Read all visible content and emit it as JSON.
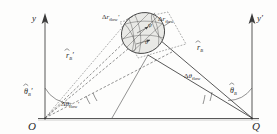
{
  "figure": {
    "background_color": "#fdfdfc",
    "line_color": "#3a3a3a",
    "blob_fill": "#e9e9e6"
  },
  "axes": [
    {
      "name": "left-axis",
      "label": "y",
      "prime": "",
      "x": 45,
      "base_y": 118,
      "top_y": 14
    },
    {
      "name": "right-axis",
      "label": "y",
      "prime": "′",
      "x": 252,
      "base_y": 118,
      "top_y": 14
    }
  ],
  "points": [
    {
      "name": "origin-O",
      "label": "O",
      "x": 33,
      "y": 119
    },
    {
      "name": "origin-Q",
      "label": "Q",
      "x": 256,
      "y": 119
    }
  ],
  "baseline": {
    "name": "baseline",
    "x1": 38,
    "y1": 118,
    "x2": 258,
    "y2": 118
  },
  "blob": {
    "name": "flow-tube-blob",
    "cx": 143,
    "cy": 33,
    "rx": 22,
    "ry": 20,
    "rotation": -28,
    "interior_labels": [
      {
        "name": "interior-angle-upper",
        "text": "ψ"
      },
      {
        "name": "interior-angle-lower",
        "text": "θ"
      }
    ]
  },
  "vectors": [
    {
      "name": "vector-r-prime-B",
      "symbol": "r",
      "hat": true,
      "prime": "′",
      "subscript": "B",
      "label_x": 66,
      "label_y": 58,
      "from": "O",
      "to": "blob",
      "style": "dashed"
    },
    {
      "name": "vector-r-B",
      "symbol": "r",
      "hat": true,
      "prime": "",
      "subscript": "B",
      "label_x": 197,
      "label_y": 50,
      "from": "Q",
      "to": "blob",
      "style": "solid"
    }
  ],
  "angles": [
    {
      "name": "angle-theta-prime-B",
      "symbol": "θ",
      "hat": true,
      "prime": "′",
      "subscript": "B",
      "label_x": 26,
      "label_y": 93,
      "at": "O"
    },
    {
      "name": "angle-theta-B",
      "symbol": "θ",
      "hat": true,
      "prime": "",
      "subscript": "B",
      "label_x": 231,
      "label_y": 92,
      "at": "Q"
    }
  ],
  "deltas": [
    {
      "name": "delta-r-prime-flow",
      "delta": "Δ",
      "symbol": "r",
      "prime": "′",
      "subscript": "flow",
      "label_x": 104,
      "label_y": 18,
      "align": "start"
    },
    {
      "name": "delta-r-flow",
      "delta": "Δ",
      "symbol": "r",
      "prime": "",
      "subscript": "flow",
      "label_x": 160,
      "label_y": 20,
      "align": "start"
    },
    {
      "name": "delta-theta-prime-flow",
      "delta": "Δ",
      "symbol": "θ",
      "prime": "′",
      "subscript": "flow",
      "label_x": 63,
      "label_y": 104,
      "align": "start"
    },
    {
      "name": "delta-theta-flow",
      "delta": "Δ",
      "symbol": "θ",
      "prime": "",
      "subscript": "flow",
      "label_x": 186,
      "label_y": 76,
      "align": "start"
    }
  ]
}
